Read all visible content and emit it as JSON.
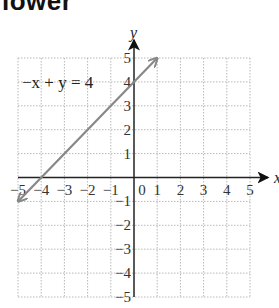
{
  "page": {
    "heading_fragment": "lower"
  },
  "chart_data": {
    "type": "line",
    "title": "",
    "xlabel": "x",
    "ylabel": "y",
    "xlim": [
      -5,
      5
    ],
    "ylim": [
      -5,
      5
    ],
    "grid": true,
    "x_ticks": [
      "-5",
      "-4",
      "-3",
      "-2",
      "-1",
      "0",
      "1",
      "2",
      "3",
      "4",
      "5"
    ],
    "y_ticks": [
      "5",
      "4",
      "3",
      "2",
      "1",
      "-1",
      "-2",
      "-3",
      "-4",
      "-5"
    ],
    "series": [
      {
        "name": "-x + y = 4",
        "equation": "-x + y = 4",
        "color": "#888888",
        "x": [
          -5,
          -4,
          0,
          1
        ],
        "y": [
          -1,
          0,
          4,
          5
        ],
        "arrows_both_ends": true
      }
    ],
    "annotations": [
      {
        "text": "−x + y = 4",
        "position": "upper-left"
      }
    ]
  }
}
